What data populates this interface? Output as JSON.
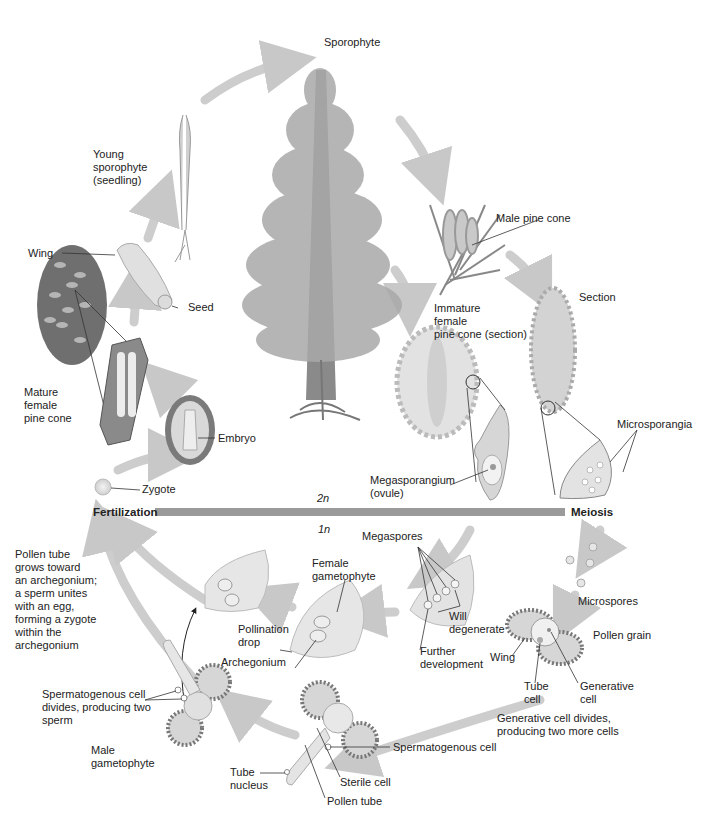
{
  "colors": {
    "arrow": "#c8c8c8",
    "ploidy_bar": "#9a9a9a",
    "tissue": "#d9d9d9",
    "outline": "#555555",
    "text": "#222222"
  },
  "ploidy": {
    "diploid": "2n",
    "haploid": "1n",
    "left_label": "Fertilization",
    "right_label": "Meiosis"
  },
  "sporophyte_stage": {
    "sporophyte": "Sporophyte",
    "male_pine_cone": "Male pine cone",
    "section": "Section",
    "immature_female_cone": "Immature\nfemale\npine cone (section)",
    "microsporangia": "Microsporangia",
    "megasporangium": "Megasporangium\n(ovule)",
    "young_sporophyte": "Young\nsporophyte\n(seedling)",
    "wing": "Wing",
    "seed": "Seed",
    "mature_female_cone": "Mature\nfemale\npine cone",
    "embryo": "Embryo",
    "zygote": "Zygote"
  },
  "gametophyte_stage": {
    "megaspores": "Megaspores",
    "will_degenerate": "Will\ndegenerate",
    "further_development": "Further\ndevelopment",
    "female_gametophyte": "Female\ngametophyte",
    "pollination_drop": "Pollination\ndrop",
    "archegonium": "Archegonium",
    "fertilization_note": "Pollen tube\ngrows toward\nan archegonium;\na sperm unites\nwith an egg,\nforming a zygote\nwithin the\narchegonium",
    "microspores": "Microspores",
    "pollen_grain": "Pollen grain",
    "pollen_wing": "Wing",
    "tube_cell": "Tube\ncell",
    "generative_cell": "Generative\ncell",
    "generative_divides": "Generative cell divides,\nproducing two more cells",
    "spermatogenous_cell": "Spermatogenous cell",
    "sterile_cell": "Sterile cell",
    "tube_nucleus": "Tube\nnucleus",
    "pollen_tube": "Pollen tube",
    "spermatogenous_divides": "Spermatogenous cell\ndivides, producing two\nsperm",
    "male_gametophyte": "Male\ngametophyte"
  }
}
